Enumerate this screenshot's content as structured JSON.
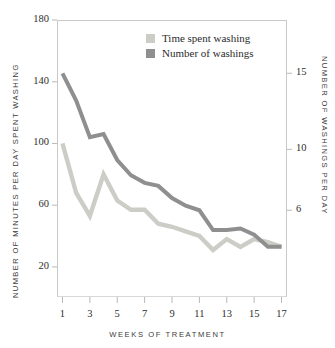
{
  "chart_data": {
    "type": "line",
    "title": "",
    "xlabel": "WEEKS OF TREATMENT",
    "ylabel": "NUMBER OF MINUTES PER DAY SPENT WASHING",
    "y2label": "NUMBER OF WASHINGS PER DAY",
    "x": [
      1,
      2,
      3,
      4,
      5,
      6,
      7,
      8,
      9,
      10,
      11,
      12,
      13,
      14,
      15,
      16,
      17
    ],
    "xlim": [
      0.6,
      17.4
    ],
    "xticks": [
      1,
      3,
      5,
      7,
      9,
      11,
      13,
      15,
      17
    ],
    "xticklabels": [
      "1",
      "3",
      "5",
      "7",
      "9",
      "11",
      "13",
      "15",
      "17"
    ],
    "ylim": [
      0.5,
      180
    ],
    "yticks": [
      20,
      60,
      100,
      140,
      180
    ],
    "yticklabels": [
      "20",
      "60",
      "100",
      "140",
      "180"
    ],
    "y2lim": [
      0.3,
      18.5
    ],
    "y2ticks": [
      6,
      10,
      15
    ],
    "y2ticklabels": [
      "6",
      "10",
      "15"
    ],
    "grid": false,
    "legend_position": "top-center",
    "series": [
      {
        "name": "Time spent washing",
        "axis": "left",
        "color": "#cdcdc8",
        "values": [
          100,
          68,
          53,
          80,
          63,
          57,
          57,
          48,
          46,
          43,
          40,
          31,
          38,
          33,
          38,
          36,
          33
        ]
      },
      {
        "name": "Number of washings",
        "axis": "right",
        "color": "#8f8f8f",
        "values": [
          15.0,
          13.2,
          10.8,
          11.0,
          9.3,
          8.3,
          7.8,
          7.6,
          6.8,
          6.3,
          6.0,
          4.7,
          4.7,
          4.8,
          4.4,
          3.6,
          3.6
        ]
      }
    ]
  },
  "legend": {
    "items": [
      {
        "label": "Time spent washing",
        "color": "#cdcdc8"
      },
      {
        "label": "Number of washings",
        "color": "#8f8f8f"
      }
    ]
  },
  "axes": {
    "left_title": "NUMBER OF MINUTES PER DAY SPENT WASHING",
    "right_title": "NUMBER OF WASHINGS PER DAY",
    "bottom_title": "WEEKS OF TREATMENT"
  },
  "colors": {
    "light_series": "#cdcdc8",
    "dark_series": "#8f8f8f",
    "frame": "#c9c9c9",
    "text": "#2d2d2d"
  }
}
